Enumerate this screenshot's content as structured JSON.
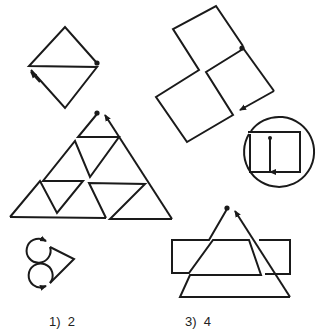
{
  "figure": {
    "colors": {
      "background": "#ffffff",
      "ink": "#1a1a1a"
    },
    "shapes": [
      {
        "name": "diamond-split-figure",
        "description": "Diamond divided by a horizontal line, traced with start dot and end arrow"
      },
      {
        "name": "two-squares-figure",
        "description": "Two tilted squares sharing a corner region, with start dot and end arrow"
      },
      {
        "name": "circle-rectangle-figure",
        "description": "Circle enclosing a rectangle with internal vertical line, start dot and arrow"
      },
      {
        "name": "triangle-grid-figure",
        "description": "Large triangle subdivided into smaller triangles, two arrow tips at apex"
      },
      {
        "name": "curl-chevron-figure",
        "description": "Two curled loops joined to a chevron, ending with arrow"
      },
      {
        "name": "triangle-rectangle-figure",
        "description": "Triangle overlapping a wide rectangle, two arrow tips at apex"
      }
    ],
    "answers": [
      {
        "number": "1)",
        "value": "2",
        "text": "1)  2"
      },
      {
        "number": "3)",
        "value": "4",
        "text": "3)  4"
      }
    ]
  }
}
